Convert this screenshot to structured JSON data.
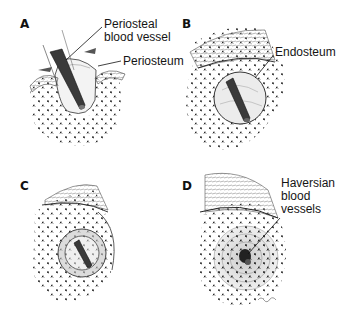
{
  "figure": {
    "colors": {
      "ink": "#1a1a1a",
      "vessel": "#3a3a3a",
      "bone_stipple": "#2a2a2a",
      "lamella_gray": "#c8c8c8",
      "background": "#ffffff"
    },
    "panels": [
      {
        "letter": "A",
        "labels": [
          {
            "text": "Periosteal\nblood vessel"
          },
          {
            "text": "Periosteum"
          }
        ]
      },
      {
        "letter": "B",
        "labels": [
          {
            "text": "Endosteum"
          }
        ]
      },
      {
        "letter": "C",
        "labels": []
      },
      {
        "letter": "D",
        "labels": [
          {
            "text": "Haversian\nblood\nvessels"
          }
        ]
      }
    ]
  }
}
